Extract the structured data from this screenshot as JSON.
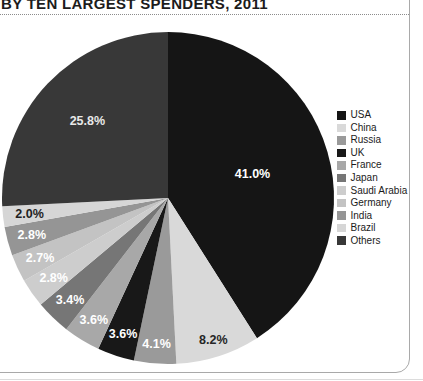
{
  "header": {
    "title": "BY TEN LARGEST SPENDERS, 2011"
  },
  "chart_data": {
    "type": "pie",
    "title": "BY TEN LARGEST SPENDERS, 2011",
    "start_angle_deg": 0,
    "direction": "clockwise",
    "legend_position": "right",
    "units": "percent",
    "slices": [
      {
        "label": "USA",
        "value": 41.0,
        "display": "41.0%",
        "color": "#151515",
        "text_color": "#ffffff",
        "label_r": 0.53
      },
      {
        "label": "China",
        "value": 8.2,
        "display": "8.2%",
        "color": "#d9d9d9",
        "text_color": "#262626",
        "label_r": 0.9
      },
      {
        "label": "Russia",
        "value": 4.1,
        "display": "4.1%",
        "color": "#9a9a9a",
        "text_color": "#ffffff",
        "label_r": 0.88
      },
      {
        "label": "UK",
        "value": 3.6,
        "display": "3.6%",
        "color": "#181818",
        "text_color": "#ffffff",
        "label_r": 0.86
      },
      {
        "label": "France",
        "value": 3.6,
        "display": "3.6%",
        "color": "#a8a8a8",
        "text_color": "#ffffff",
        "label_r": 0.86
      },
      {
        "label": "Japan",
        "value": 3.4,
        "display": "3.4%",
        "color": "#767676",
        "text_color": "#ffffff",
        "label_r": 0.85
      },
      {
        "label": "Saudi Arabia",
        "value": 2.8,
        "display": "2.8%",
        "color": "#cdcdcd",
        "text_color": "#ffffff",
        "label_r": 0.84
      },
      {
        "label": "Germany",
        "value": 2.7,
        "display": "2.7%",
        "color": "#c3c3c3",
        "text_color": "#ffffff",
        "label_r": 0.85
      },
      {
        "label": "India",
        "value": 2.8,
        "display": "2.8%",
        "color": "#959595",
        "text_color": "#ffffff",
        "label_r": 0.85
      },
      {
        "label": "Brazil",
        "value": 2.0,
        "display": "2.0%",
        "color": "#d6d6d6",
        "text_color": "#1f1f1f",
        "label_r": 0.84
      },
      {
        "label": "Others",
        "value": 25.8,
        "display": "25.8%",
        "color": "#383838",
        "text_color": "#e8e8e8",
        "label_r": 0.67
      }
    ]
  }
}
